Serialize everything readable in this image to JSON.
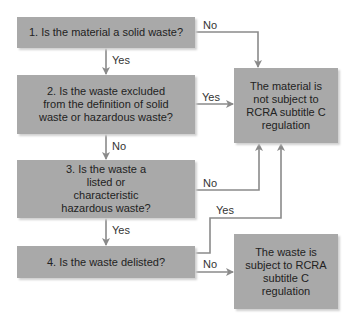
{
  "diagram": {
    "type": "flowchart",
    "colors": {
      "box_fill": "#a9a9a9",
      "line": "#8a8a8a",
      "text": "#222222"
    },
    "questions": [
      {
        "id": "q1",
        "text": "1. Is the material a solid waste?"
      },
      {
        "id": "q2",
        "text": "2. Is the waste excluded from the definition of solid waste or hazardous waste?"
      },
      {
        "id": "q3",
        "text": "3. Is the waste a listed or characteristic hazardous waste?"
      },
      {
        "id": "q4",
        "text": "4. Is the waste delisted?"
      }
    ],
    "outcomes": [
      {
        "id": "not_subject",
        "text": "The material is not subject to RCRA subtitle C regulation"
      },
      {
        "id": "subject",
        "text": "The waste is subject to RCRA subtitle C regulation"
      }
    ],
    "edges": [
      {
        "from": "q1",
        "to": "not_subject",
        "label": "No"
      },
      {
        "from": "q1",
        "to": "q2",
        "label": "Yes"
      },
      {
        "from": "q2",
        "to": "not_subject",
        "label": "Yes"
      },
      {
        "from": "q2",
        "to": "q3",
        "label": "No"
      },
      {
        "from": "q3",
        "to": "not_subject",
        "label": "No"
      },
      {
        "from": "q3",
        "to": "q4",
        "label": "Yes"
      },
      {
        "from": "q4",
        "to": "not_subject",
        "label": "Yes"
      },
      {
        "from": "q4",
        "to": "subject",
        "label": "No"
      }
    ]
  }
}
